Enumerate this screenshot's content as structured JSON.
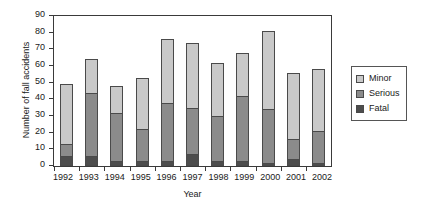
{
  "chart_data": {
    "type": "bar",
    "subtype": "stacked",
    "title": "",
    "xlabel": "Year",
    "ylabel": "Number of fall accidents",
    "categories": [
      "1992",
      "1993",
      "1994",
      "1995",
      "1996",
      "1997",
      "1998",
      "1999",
      "2000",
      "2001",
      "2002"
    ],
    "series": [
      {
        "name": "Fatal",
        "color": "#4d4d4d",
        "values": [
          6,
          6,
          3,
          3,
          3,
          7,
          3,
          3,
          2,
          4,
          2
        ]
      },
      {
        "name": "Serious",
        "color": "#8b8b8b",
        "values": [
          7,
          38,
          29,
          19,
          35,
          28,
          27,
          39,
          32,
          12,
          19
        ]
      },
      {
        "name": "Minor",
        "color": "#c9c9c9",
        "values": [
          36,
          20,
          16,
          31,
          38,
          39,
          32,
          26,
          47,
          40,
          37
        ]
      }
    ],
    "totals": [
      49,
      64,
      48,
      53,
      76,
      74,
      62,
      68,
      81,
      56,
      58
    ],
    "ylim": [
      0,
      90
    ],
    "ytick_step": 10,
    "yticks": [
      0,
      10,
      20,
      30,
      40,
      50,
      60,
      70,
      80,
      90
    ],
    "grid": false,
    "legend_position": "right",
    "legend_order": [
      "Minor",
      "Serious",
      "Fatal"
    ]
  },
  "axes": {
    "y_title": "Number of fall accidents",
    "x_title": "Year"
  },
  "legend": {
    "entries": [
      {
        "label": "Minor",
        "color": "#c9c9c9"
      },
      {
        "label": "Serious",
        "color": "#8b8b8b"
      },
      {
        "label": "Fatal",
        "color": "#4d4d4d"
      }
    ]
  }
}
